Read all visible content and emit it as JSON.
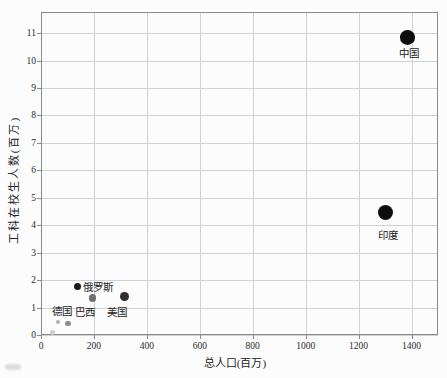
{
  "figure": {
    "background": "#fcfcfc",
    "plot_border_color": "#8a8a8a",
    "grid_color": "#cfd2d4",
    "text_color": "#222222"
  },
  "chart_data": {
    "type": "scatter",
    "title": "",
    "xlabel": "总人口(百万)",
    "ylabel": "工科在校生人数(百万)",
    "xlim": [
      0,
      1500
    ],
    "ylim": [
      0,
      11.77
    ],
    "x_ticks": [
      0,
      200,
      400,
      600,
      800,
      1000,
      1200,
      1400
    ],
    "y_ticks": [
      0,
      1,
      2,
      3,
      4,
      5,
      6,
      7,
      8,
      9,
      10,
      11
    ],
    "grid": true,
    "legend": "none",
    "points": [
      {
        "label": "中国",
        "x": 1385,
        "y": 10.85,
        "r": 7.3,
        "color": "#0d0d0d",
        "label_offset": [
          1,
          15
        ]
      },
      {
        "label": "印度",
        "x": 1302,
        "y": 4.45,
        "r": 7.6,
        "color": "#0d0d0d",
        "label_offset": [
          2,
          21
        ]
      },
      {
        "label": "俄罗斯",
        "x": 137,
        "y": 1.76,
        "r": 3.6,
        "color": "#1a1a1a",
        "label_offset": [
          21,
          -1
        ]
      },
      {
        "label": "美国",
        "x": 314,
        "y": 1.4,
        "r": 4.4,
        "color": "#303030",
        "label_offset": [
          -7,
          14
        ]
      },
      {
        "label": "巴西",
        "x": 196,
        "y": 1.35,
        "r": 3.6,
        "color": "#707070",
        "label_offset": [
          -8,
          13
        ]
      },
      {
        "label": "德国",
        "x": 102,
        "y": 0.42,
        "r": 2.9,
        "color": "#8f8f8f",
        "label_offset": [
          -6,
          -13
        ]
      },
      {
        "label": "",
        "x": 64,
        "y": 0.47,
        "r": 2.4,
        "color": "#b0b0b0",
        "label_offset": [
          0,
          0
        ]
      },
      {
        "label": "",
        "x": 42,
        "y": 0.09,
        "r": 2.4,
        "color": "#cfcfcf",
        "label_offset": [
          0,
          0
        ]
      }
    ]
  }
}
